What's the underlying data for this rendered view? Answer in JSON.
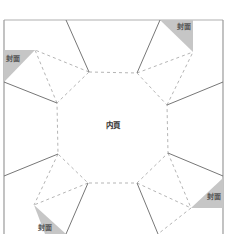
{
  "diagram": {
    "title": "",
    "center_label": "内頁",
    "cover_label": "封面",
    "colors": {
      "border": "#aaaaaa",
      "solid_line": "#777777",
      "dashed_line": "#b5b5b5",
      "triangle_fill": "#c8c8c8",
      "label": "#555555"
    },
    "covers": [
      {
        "position": "top-left",
        "label": "封面"
      },
      {
        "position": "top-right",
        "label": "封面"
      },
      {
        "position": "bottom-right",
        "label": "封面"
      },
      {
        "position": "bottom-left",
        "label": "封面"
      }
    ]
  }
}
